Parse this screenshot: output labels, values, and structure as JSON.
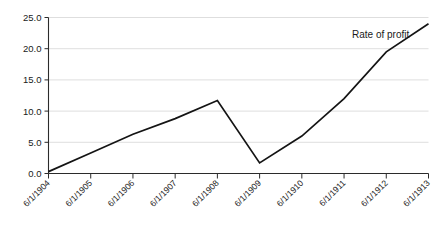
{
  "chart_data": {
    "type": "line",
    "title": "",
    "subtitle": "",
    "xlabel": "",
    "ylabel": "",
    "annotations": [
      {
        "text": "Rate of profit",
        "x_px": 352,
        "y_px": 38
      }
    ],
    "legend": {
      "position": "none",
      "entries": [
        "Rate of profit"
      ]
    },
    "grid": {
      "horizontal": true,
      "vertical": false
    },
    "ylim": [
      0.0,
      25.0
    ],
    "yticks": [
      0.0,
      5.0,
      10.0,
      15.0,
      20.0,
      25.0
    ],
    "ytick_labels": [
      "0.0",
      "5.0",
      "10.0",
      "15.0",
      "20.0",
      "25.0"
    ],
    "categories": [
      "6/1/1904",
      "6/1/1905",
      "6/1/1906",
      "6/1/1907",
      "6/1/1908",
      "6/1/1909",
      "6/1/1910",
      "6/1/1911",
      "6/1/1912",
      "6/1/1913"
    ],
    "series": [
      {
        "name": "Rate of profit",
        "color": "#141414",
        "values": [
          0.3,
          3.3,
          6.3,
          8.8,
          11.7,
          1.7,
          6.0,
          12.0,
          19.5,
          24.0
        ]
      }
    ]
  },
  "axes": {
    "y_axis_name": "value-axis",
    "x_axis_name": "date-axis"
  }
}
